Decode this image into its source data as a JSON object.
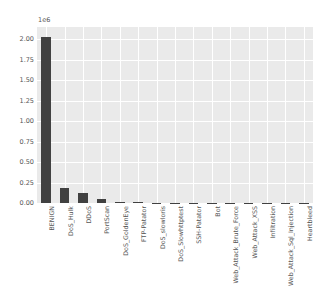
{
  "chart_data": {
    "type": "bar",
    "title": "",
    "xlabel": "",
    "ylabel": "",
    "exponent_label": "1e6",
    "grid": true,
    "legend": "none",
    "ylim": [
      0,
      2150000
    ],
    "ytick_values": [
      0,
      250000,
      500000,
      750000,
      1000000,
      1250000,
      1500000,
      1750000,
      2000000
    ],
    "ytick_labels": [
      "0.00",
      "0.25",
      "0.50",
      "0.75",
      "1.00",
      "1.25",
      "1.50",
      "1.75",
      "2.00"
    ],
    "categories": [
      "BENIGN",
      "DoS_Hulk",
      "DDoS",
      "PortScan",
      "DoS_GoldenEye",
      "FTP-Patator",
      "DoS_slowloris",
      "DoS_Slowhttptest",
      "SSH-Patator",
      "Bot",
      "Web_Attack_Brute_Force",
      "Web_Attack_XSS",
      "Infiltration",
      "Web_Attack_Sql_Injection",
      "Heartbleed"
    ],
    "values": [
      2030000,
      180000,
      128000,
      52000,
      10000,
      8000,
      6000,
      5000,
      4000,
      2000,
      1500,
      700,
      40,
      20,
      10
    ],
    "bar_color": "#414141",
    "plot_background": "#eaeaea",
    "gridline_color": "#ffffff",
    "figure_background": "#ffffff"
  }
}
